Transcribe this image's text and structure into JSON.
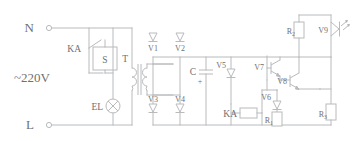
{
  "diagram": {
    "line_color": "#b9babc",
    "text_color": "#6f7073",
    "background": "#ffffff"
  },
  "terminals": {
    "neutral": "N",
    "live": "L",
    "supply": "~220V"
  },
  "components": {
    "relay_contact": "KA",
    "switch": "S",
    "lamp": "EL",
    "transformer": "T",
    "diode_v1": "V1",
    "diode_v2": "V2",
    "diode_v3": "V3",
    "diode_v4": "V4",
    "capacitor": "C",
    "capacitor_polarity": "+",
    "diode_v5": "V5",
    "transistor_v7": "V7",
    "transistor_v8": "V8",
    "diode_v6": "V6",
    "led_v9": "V9",
    "relay_coil": "KA",
    "resistor_r1": "R",
    "resistor_r1_sub": "1",
    "resistor_r2": "R",
    "resistor_r2_sub": "2",
    "resistor_r3": "R",
    "resistor_r3_sub": "3"
  }
}
